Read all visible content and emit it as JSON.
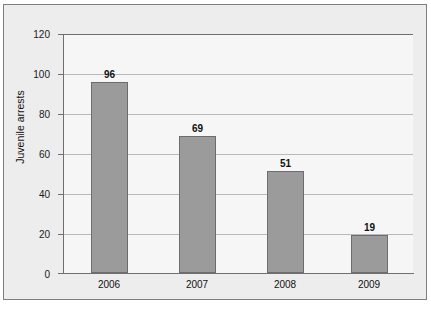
{
  "chart_data": {
    "type": "bar",
    "title": "",
    "xlabel": "",
    "ylabel": "Juvenile arrests",
    "categories": [
      "2006",
      "2007",
      "2008",
      "2009"
    ],
    "values": [
      96,
      69,
      51,
      19
    ],
    "value_labels": [
      "96",
      "69",
      "51",
      "19"
    ],
    "ylim": [
      0,
      120
    ],
    "yticks": [
      0,
      20,
      40,
      60,
      80,
      100,
      120
    ],
    "ytick_labels": [
      "0",
      "20",
      "40",
      "60",
      "80",
      "100",
      "120"
    ],
    "grid": true,
    "grid_axis": "y",
    "legend": false,
    "colors": {
      "bar_fill": "#9b9b9b",
      "bar_edge": "#6d6d6d",
      "gridline": "#b9b9b9",
      "axis": "#6f6f6f",
      "figure_background": "#ededed",
      "plot_background": "#f6f6f6",
      "text": "#111111"
    }
  }
}
